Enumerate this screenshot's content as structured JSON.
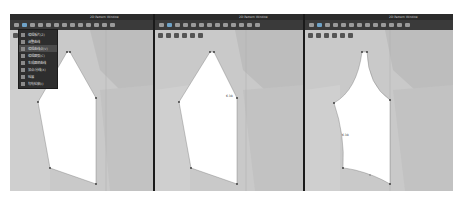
{
  "panels": [
    {
      "title": "2D Pattern Window",
      "toolbar_icon_count": 13,
      "menu": {
        "visible": true,
        "items": [
          {
            "label": "编辑板片(Z)",
            "icon": "edit-pattern-icon"
          },
          {
            "label": "调整曲线",
            "icon": "adjust-curve-icon"
          },
          {
            "label": "编辑曲线点(V)",
            "icon": "edit-curve-point-icon",
            "active": true
          },
          {
            "label": "编辑圆弧(C)",
            "icon": "edit-arc-icon"
          },
          {
            "label": "生成圆顺曲线",
            "icon": "smooth-curve-icon"
          },
          {
            "label": "加点/分线(X)",
            "icon": "add-point-icon"
          },
          {
            "label": "延展",
            "icon": "extend-icon"
          },
          {
            "label": "勾勒轮廓(I)",
            "icon": "trace-outline-icon"
          }
        ]
      },
      "measure_label": ""
    },
    {
      "title": "2D Pattern Window",
      "toolbar_icon_count": 13,
      "measure_label": "6.38"
    },
    {
      "title": "2D Pattern Window",
      "toolbar_icon_count": 13,
      "measure_label": "6.38"
    }
  ],
  "colors": {
    "titlebar": "#2b2b2b",
    "toolbar": "#3a3a3a",
    "canvas": "#c9c9c9",
    "pattern_fill": "#ffffff",
    "highlight": "#6fa3c8"
  }
}
